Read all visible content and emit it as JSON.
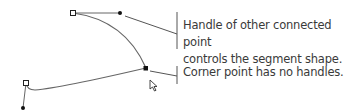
{
  "callouts": [
    {
      "lines": [
        "Handle of other connected point",
        "controls the segment shape."
      ]
    },
    {
      "lines": [
        "Corner point has no handles."
      ]
    }
  ],
  "colors": {
    "path": "#555555",
    "point": "#111111",
    "text": "#3a3a3a"
  },
  "icons": {
    "cursor": "direct-selection-arrow-icon"
  }
}
